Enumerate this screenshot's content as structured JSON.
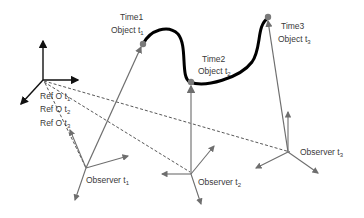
{
  "diagram": {
    "colors": {
      "trajectory": "#000000",
      "axis": "#6e6e6e",
      "ref_axis": "#111111",
      "dashed": "#444444",
      "point": "#7a7a7a",
      "text": "#3a3a3a"
    },
    "reference_frame": {
      "labels": [
        {
          "main": "Ref O t",
          "sub": "1"
        },
        {
          "main": "Ref O t",
          "sub": "2"
        },
        {
          "main": "Ref O t",
          "sub": "3"
        }
      ]
    },
    "objects": [
      {
        "time": "Time1",
        "main": "Object t",
        "sub": "1"
      },
      {
        "time": "Time2",
        "main": "Object t",
        "sub": "2"
      },
      {
        "time": "Time3",
        "main": "Object t",
        "sub": "3"
      }
    ],
    "observers": [
      {
        "main": "Observer t",
        "sub": "1"
      },
      {
        "main": "Observer t",
        "sub": "2"
      },
      {
        "main": "Observer t",
        "sub": "3"
      }
    ]
  }
}
